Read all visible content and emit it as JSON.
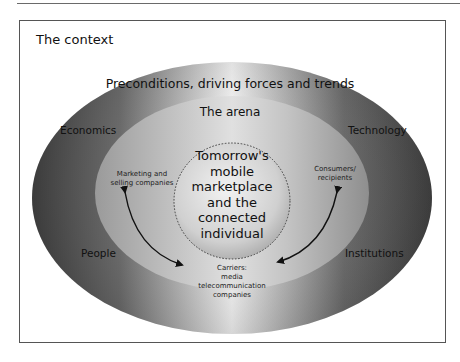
{
  "figure": {
    "context_title": "The context",
    "outer_ring": {
      "title": "Preconditions, driving forces and trends",
      "forces": {
        "top_left": "Economics",
        "top_right": "Technology",
        "bottom_left": "People",
        "bottom_right": "Institutions"
      }
    },
    "arena": {
      "title": "The arena",
      "actors": {
        "left": [
          "Marketing and",
          "selling companies"
        ],
        "right": [
          "Consumers/",
          "recipients"
        ],
        "bottom": [
          "Carriers:",
          "media",
          "telecommunication",
          "companies"
        ]
      }
    },
    "core": {
      "lines": [
        "Tomorrow's",
        "mobile",
        "marketplace",
        "and the",
        "connected",
        "individual"
      ]
    },
    "arrows": [
      {
        "from": "bottom",
        "to": "left",
        "type": "double-headed-curve"
      },
      {
        "from": "bottom",
        "to": "right",
        "type": "double-headed-curve"
      }
    ],
    "colors": {
      "outer_dark": "#4a4a4a",
      "outer_light": "#f4f4f4",
      "arena_fill": "#bdbdbd",
      "core_fill": "#d8d8d8",
      "frame": "#555555",
      "text": "#111111"
    }
  }
}
